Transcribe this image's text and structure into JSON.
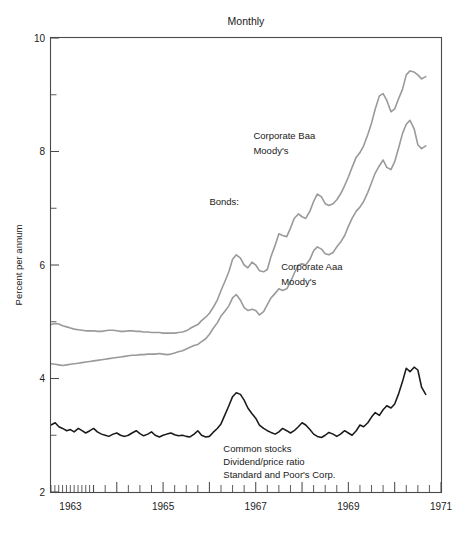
{
  "chart_data": {
    "type": "line",
    "title": "Monthly",
    "xlabel": "",
    "ylabel": "Percent per annum",
    "xlim": [
      1962.58,
      1971.0
    ],
    "ylim": [
      2,
      10
    ],
    "grid": false,
    "legend_position": "inline-annotations",
    "y_ticks_major": [
      2,
      4,
      6,
      8,
      10
    ],
    "y_ticks_minor": [
      3,
      5,
      7,
      9
    ],
    "y_tick_labels": [
      "2",
      "4",
      "6",
      "8",
      "10"
    ],
    "x_ticks_major": [
      1963,
      1965,
      1967,
      1969,
      1971
    ],
    "x_tick_labels": [
      "1963",
      "1965",
      "1967",
      "1969",
      "1971"
    ],
    "annotations": [
      {
        "name": "bonds-group-label",
        "text": "Bonds:",
        "x": 1966.0,
        "y": 7.05
      },
      {
        "name": "baa-series-label",
        "text": "Corporate Baa",
        "x": 1966.95,
        "y": 8.22
      },
      {
        "name": "baa-series-sublabel",
        "text": "Moody's",
        "x": 1966.95,
        "y": 7.95
      },
      {
        "name": "aaa-series-label",
        "text": "Corporate Aaa",
        "x": 1967.55,
        "y": 5.92
      },
      {
        "name": "aaa-series-sublabel",
        "text": "Moody's",
        "x": 1967.55,
        "y": 5.65
      },
      {
        "name": "stocks-series-label-1",
        "text": "Common stocks",
        "x": 1966.3,
        "y": 2.7
      },
      {
        "name": "stocks-series-label-2",
        "text": "Dividend/price ratio",
        "x": 1966.3,
        "y": 2.47
      },
      {
        "name": "stocks-series-label-3",
        "text": "Standard and Poor's Corp.",
        "x": 1966.3,
        "y": 2.24
      }
    ],
    "series": [
      {
        "name": "Corporate Baa Moody's",
        "color": "#9a9a9a",
        "width": 1.6,
        "x": [
          1962.58,
          1962.67,
          1962.75,
          1962.83,
          1962.92,
          1963.0,
          1963.08,
          1963.17,
          1963.25,
          1963.33,
          1963.42,
          1963.5,
          1963.58,
          1963.67,
          1963.75,
          1963.83,
          1963.92,
          1964.0,
          1964.08,
          1964.17,
          1964.25,
          1964.33,
          1964.42,
          1964.5,
          1964.58,
          1964.67,
          1964.75,
          1964.83,
          1964.92,
          1965.0,
          1965.08,
          1965.17,
          1965.25,
          1965.33,
          1965.42,
          1965.5,
          1965.58,
          1965.67,
          1965.75,
          1965.83,
          1965.92,
          1966.0,
          1966.08,
          1966.17,
          1966.25,
          1966.33,
          1966.42,
          1966.5,
          1966.58,
          1966.67,
          1966.75,
          1966.83,
          1966.92,
          1967.0,
          1967.08,
          1967.17,
          1967.25,
          1967.33,
          1967.42,
          1967.5,
          1967.58,
          1967.67,
          1967.75,
          1967.83,
          1967.92,
          1968.0,
          1968.08,
          1968.17,
          1968.25,
          1968.33,
          1968.42,
          1968.5,
          1968.58,
          1968.67,
          1968.75,
          1968.83,
          1968.92,
          1969.0,
          1969.08,
          1969.17,
          1969.25,
          1969.33,
          1969.42,
          1969.5,
          1969.58,
          1969.67,
          1969.75,
          1969.83,
          1969.92,
          1970.0,
          1970.08,
          1970.17,
          1970.25,
          1970.33,
          1970.42,
          1970.5,
          1970.58,
          1970.67
        ],
        "values": [
          4.95,
          4.97,
          4.96,
          4.93,
          4.91,
          4.89,
          4.87,
          4.86,
          4.85,
          4.84,
          4.84,
          4.84,
          4.83,
          4.83,
          4.84,
          4.85,
          4.85,
          4.84,
          4.83,
          4.83,
          4.84,
          4.84,
          4.83,
          4.83,
          4.82,
          4.82,
          4.81,
          4.81,
          4.81,
          4.8,
          4.8,
          4.8,
          4.8,
          4.81,
          4.82,
          4.84,
          4.88,
          4.92,
          4.95,
          5.02,
          5.08,
          5.15,
          5.25,
          5.38,
          5.55,
          5.7,
          5.88,
          6.1,
          6.18,
          6.12,
          6.0,
          5.95,
          6.05,
          6.0,
          5.9,
          5.88,
          5.92,
          6.15,
          6.35,
          6.55,
          6.52,
          6.5,
          6.65,
          6.82,
          6.9,
          6.85,
          6.82,
          6.95,
          7.12,
          7.25,
          7.2,
          7.08,
          7.05,
          7.08,
          7.15,
          7.25,
          7.4,
          7.55,
          7.72,
          7.9,
          7.98,
          8.1,
          8.3,
          8.5,
          8.75,
          8.98,
          9.02,
          8.9,
          8.7,
          8.75,
          8.92,
          9.1,
          9.35,
          9.42,
          9.4,
          9.35,
          9.28,
          9.32
        ]
      },
      {
        "name": "Corporate Aaa Moody's",
        "color": "#9a9a9a",
        "width": 1.6,
        "x": [
          1962.58,
          1962.67,
          1962.75,
          1962.83,
          1962.92,
          1963.0,
          1963.08,
          1963.17,
          1963.25,
          1963.33,
          1963.42,
          1963.5,
          1963.58,
          1963.67,
          1963.75,
          1963.83,
          1963.92,
          1964.0,
          1964.08,
          1964.17,
          1964.25,
          1964.33,
          1964.42,
          1964.5,
          1964.58,
          1964.67,
          1964.75,
          1964.83,
          1964.92,
          1965.0,
          1965.08,
          1965.17,
          1965.25,
          1965.33,
          1965.42,
          1965.5,
          1965.58,
          1965.67,
          1965.75,
          1965.83,
          1965.92,
          1966.0,
          1966.08,
          1966.17,
          1966.25,
          1966.33,
          1966.42,
          1966.5,
          1966.58,
          1966.67,
          1966.75,
          1966.83,
          1966.92,
          1967.0,
          1967.08,
          1967.17,
          1967.25,
          1967.33,
          1967.42,
          1967.5,
          1967.58,
          1967.67,
          1967.75,
          1967.83,
          1967.92,
          1968.0,
          1968.08,
          1968.17,
          1968.25,
          1968.33,
          1968.42,
          1968.5,
          1968.58,
          1968.67,
          1968.75,
          1968.83,
          1968.92,
          1969.0,
          1969.08,
          1969.17,
          1969.25,
          1969.33,
          1969.42,
          1969.5,
          1969.58,
          1969.67,
          1969.75,
          1969.83,
          1969.92,
          1970.0,
          1970.08,
          1970.17,
          1970.25,
          1970.33,
          1970.42,
          1970.5,
          1970.58,
          1970.67
        ],
        "values": [
          4.26,
          4.25,
          4.24,
          4.23,
          4.24,
          4.25,
          4.26,
          4.27,
          4.28,
          4.29,
          4.3,
          4.31,
          4.32,
          4.33,
          4.34,
          4.35,
          4.36,
          4.37,
          4.38,
          4.39,
          4.4,
          4.41,
          4.41,
          4.42,
          4.42,
          4.43,
          4.43,
          4.43,
          4.44,
          4.43,
          4.42,
          4.43,
          4.45,
          4.47,
          4.49,
          4.52,
          4.55,
          4.58,
          4.6,
          4.65,
          4.7,
          4.78,
          4.88,
          4.98,
          5.1,
          5.18,
          5.28,
          5.42,
          5.48,
          5.38,
          5.25,
          5.2,
          5.22,
          5.2,
          5.12,
          5.18,
          5.3,
          5.42,
          5.5,
          5.58,
          5.55,
          5.58,
          5.7,
          5.85,
          6.0,
          6.02,
          6.0,
          6.1,
          6.25,
          6.32,
          6.28,
          6.2,
          6.18,
          6.22,
          6.32,
          6.4,
          6.52,
          6.68,
          6.82,
          6.95,
          7.02,
          7.12,
          7.28,
          7.45,
          7.62,
          7.75,
          7.85,
          7.72,
          7.68,
          7.82,
          8.05,
          8.32,
          8.48,
          8.55,
          8.4,
          8.12,
          8.05,
          8.1
        ]
      },
      {
        "name": "Common stocks dividend/price ratio",
        "color": "#1a1a1a",
        "width": 1.55,
        "x": [
          1962.58,
          1962.67,
          1962.75,
          1962.83,
          1962.92,
          1963.0,
          1963.08,
          1963.17,
          1963.25,
          1963.33,
          1963.42,
          1963.5,
          1963.58,
          1963.67,
          1963.75,
          1963.83,
          1963.92,
          1964.0,
          1964.08,
          1964.17,
          1964.25,
          1964.33,
          1964.42,
          1964.5,
          1964.58,
          1964.67,
          1964.75,
          1964.83,
          1964.92,
          1965.0,
          1965.08,
          1965.17,
          1965.25,
          1965.33,
          1965.42,
          1965.5,
          1965.58,
          1965.67,
          1965.75,
          1965.83,
          1965.92,
          1966.0,
          1966.08,
          1966.17,
          1966.25,
          1966.33,
          1966.42,
          1966.5,
          1966.58,
          1966.67,
          1966.75,
          1966.83,
          1966.92,
          1967.0,
          1967.08,
          1967.17,
          1967.25,
          1967.33,
          1967.42,
          1967.5,
          1967.58,
          1967.67,
          1967.75,
          1967.83,
          1967.92,
          1968.0,
          1968.08,
          1968.17,
          1968.25,
          1968.33,
          1968.42,
          1968.5,
          1968.58,
          1968.67,
          1968.75,
          1968.83,
          1968.92,
          1969.0,
          1969.08,
          1969.17,
          1969.25,
          1969.33,
          1969.42,
          1969.5,
          1969.58,
          1969.67,
          1969.75,
          1969.83,
          1969.92,
          1970.0,
          1970.08,
          1970.17,
          1970.25,
          1970.33,
          1970.42,
          1970.5,
          1970.58,
          1970.67
        ],
        "values": [
          3.18,
          3.22,
          3.15,
          3.12,
          3.08,
          3.1,
          3.06,
          3.12,
          3.08,
          3.04,
          3.08,
          3.12,
          3.06,
          3.02,
          3.0,
          2.98,
          3.02,
          3.04,
          3.0,
          2.98,
          3.0,
          3.04,
          3.08,
          3.03,
          2.99,
          3.02,
          3.06,
          3.0,
          2.97,
          3.0,
          3.02,
          3.04,
          3.01,
          2.99,
          3.0,
          2.98,
          2.97,
          3.02,
          3.08,
          3.0,
          2.97,
          2.98,
          3.05,
          3.12,
          3.2,
          3.35,
          3.52,
          3.68,
          3.75,
          3.72,
          3.62,
          3.48,
          3.38,
          3.3,
          3.18,
          3.12,
          3.08,
          3.05,
          3.02,
          3.06,
          3.12,
          3.08,
          3.04,
          3.08,
          3.15,
          3.22,
          3.18,
          3.1,
          3.02,
          2.98,
          2.96,
          3.0,
          3.05,
          3.02,
          2.98,
          3.02,
          3.08,
          3.04,
          3.0,
          3.08,
          3.18,
          3.15,
          3.22,
          3.32,
          3.4,
          3.35,
          3.45,
          3.52,
          3.48,
          3.55,
          3.72,
          3.95,
          4.18,
          4.12,
          4.2,
          4.15,
          3.85,
          3.72
        ]
      }
    ]
  }
}
